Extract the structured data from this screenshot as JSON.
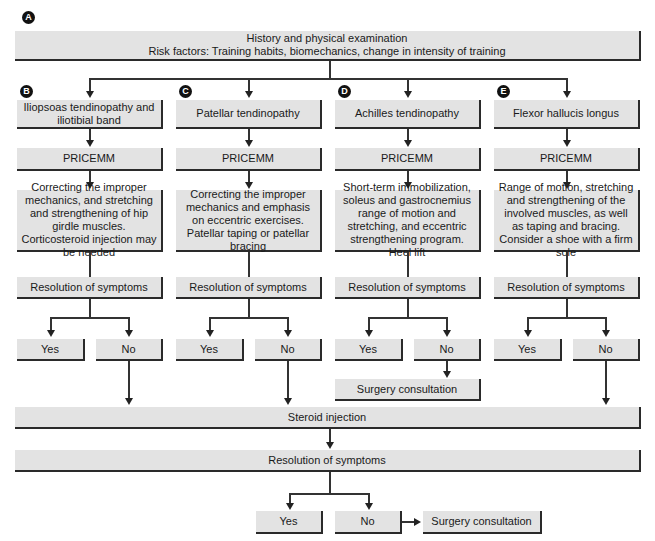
{
  "badges": {
    "a": "A",
    "b": "B",
    "c": "C",
    "d": "D",
    "e": "E"
  },
  "top": {
    "line1": "History and physical examination",
    "line2": "Risk factors: Training habits, biomechanics, change in intensity of training"
  },
  "columns": [
    {
      "title": "Iliopsoas tendinopathy and iliotibial band",
      "step": "PRICEMM",
      "treatment": "Correcting the improper mechanics, and stretching and strengthening of hip girdle muscles. Corticosteroid injection may be needed",
      "resolution": "Resolution of symptoms",
      "yes": "Yes",
      "no": "No"
    },
    {
      "title": "Patellar tendinopathy",
      "step": "PRICEMM",
      "treatment": "Correcting the improper mechanics and emphasis on eccentric exercises. Patellar taping or patellar bracing",
      "resolution": "Resolution of symptoms",
      "yes": "Yes",
      "no": "No"
    },
    {
      "title": "Achilles tendinopathy",
      "step": "PRICEMM",
      "treatment": "Short-term immobilization, soleus and gastrocnemius range of motion and stretching, and eccentric strengthening program. Heel lift",
      "resolution": "Resolution of symptoms",
      "yes": "Yes",
      "no": "No",
      "no_outcome": "Surgery consultation"
    },
    {
      "title": "Flexor hallucis longus",
      "step": "PRICEMM",
      "treatment": "Range of motion, stretching and strengthening of the involved muscles, as well as taping and bracing. Consider a shoe with a firm sole",
      "resolution": "Resolution of symptoms",
      "yes": "Yes",
      "no": "No"
    }
  ],
  "steroid": "Steroid injection",
  "final": {
    "resolution": "Resolution of symptoms",
    "yes": "Yes",
    "no": "No",
    "no_outcome": "Surgery consultation"
  },
  "colors": {
    "box_fill": "#e3e3e3",
    "box_shadow": "#2a2a2a",
    "line": "#333333"
  }
}
